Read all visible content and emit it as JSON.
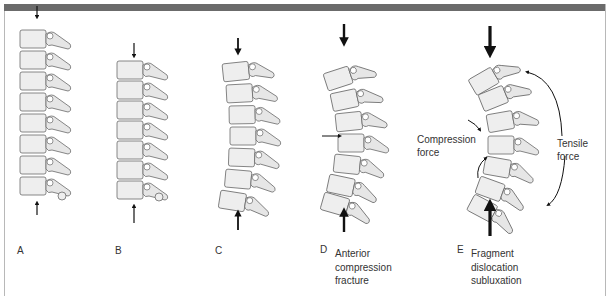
{
  "figure": {
    "header_bar_color": "#6b6b6b",
    "border_color": "#b8b8b8",
    "bone_fill": "#eeeeee",
    "bone_stroke": "#6a6a6a",
    "arrow_color": "#111111"
  },
  "panels": [
    {
      "letter": "A",
      "caption_lines": []
    },
    {
      "letter": "B",
      "caption_lines": []
    },
    {
      "letter": "C",
      "caption_lines": []
    },
    {
      "letter": "D",
      "caption_lines": [
        "Anterior",
        "compression",
        "fracture"
      ]
    },
    {
      "letter": "E",
      "caption_lines": [
        "Fragment",
        "dislocation",
        "subluxation"
      ]
    }
  ],
  "annotations": {
    "compression_force": [
      "Compression",
      "force"
    ],
    "tensile_force": [
      "Tensile",
      "force"
    ]
  }
}
